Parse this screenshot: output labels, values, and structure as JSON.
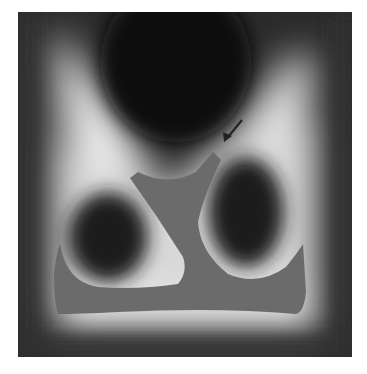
{
  "figure": {
    "colors": {
      "background": "#ffffff",
      "dark_region": "#1a1a1a",
      "bright_ridge": "#f2f2f2",
      "flat_shape": "#6b6b6b",
      "arrow": "#222222"
    },
    "annotations": [
      {
        "type": "arrow",
        "label": "",
        "from": [
          242,
          120
        ],
        "to": [
          224,
          142
        ]
      }
    ]
  }
}
